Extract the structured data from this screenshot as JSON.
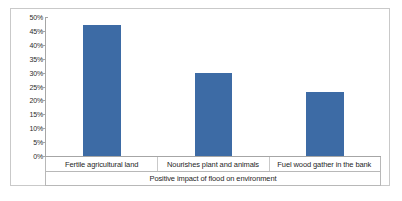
{
  "chart_data": {
    "type": "bar",
    "title": "",
    "xlabel": "Positive impact of flood on environment",
    "ylabel": "",
    "categories": [
      "Fertile agricultural land",
      "Nourishes plant and animals",
      "Fuel wood gather in the bank"
    ],
    "values": [
      47,
      30,
      23
    ],
    "ylim": [
      0,
      50
    ],
    "ytick_labels": [
      "0%",
      "5%",
      "10%",
      "15%",
      "20%",
      "25%",
      "30%",
      "35%",
      "40%",
      "45%",
      "50%"
    ],
    "ytick_values": [
      0,
      5,
      10,
      15,
      20,
      25,
      30,
      35,
      40,
      45,
      50
    ],
    "grid": false,
    "legend": false,
    "bar_color": "#3d6ba5",
    "axis_color": "#a6a6a6",
    "border_color": "#c9c9c9",
    "background_color": "#ffffff",
    "text_color": "#1f1f1f"
  }
}
